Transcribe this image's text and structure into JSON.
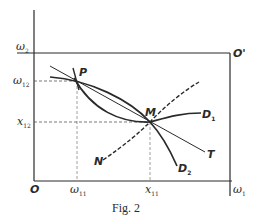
{
  "figure": {
    "caption": "Fig. 2",
    "colors": {
      "ink": "#2a2a2a",
      "background": "#ffffff"
    }
  },
  "labels": {
    "origin": "O",
    "origin_prime": "O'",
    "omega2": "ω",
    "omega2_sub": "2",
    "omega12": "ω",
    "omega12_sub": "12",
    "x12": "x",
    "x12_sub": "12",
    "omega11": "ω",
    "omega11_sub": "11",
    "x11": "x",
    "x11_sub": "11",
    "omega1": "ω",
    "omega1_sub": "1",
    "P": "P",
    "M": "M",
    "N": "N",
    "T": "T",
    "D1": "D",
    "D1_sub": "1",
    "D2": "D",
    "D2_sub": "2"
  },
  "points": {
    "P": {
      "x": "ω11",
      "y": "ω12"
    },
    "M": {
      "x": "x11",
      "y": "x12"
    }
  }
}
